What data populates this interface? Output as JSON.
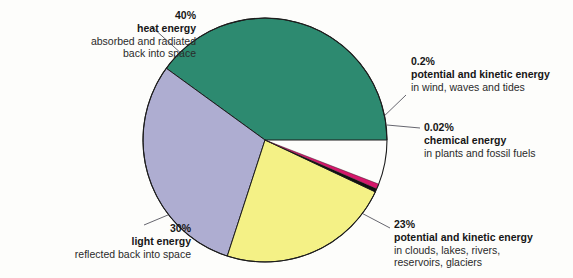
{
  "figure": {
    "background": "#fdfdfb",
    "pie": {
      "center_x": 265,
      "center_y": 140,
      "radius": 122,
      "outline_color": "#1d1d1d"
    }
  },
  "chart_data": {
    "type": "pie",
    "title": "",
    "subtitle": "",
    "xlabel": "",
    "ylabel": "",
    "legend_position": "callouts-around-pie",
    "grid": false,
    "total_percent": 93.22,
    "categories": [
      "heat energy",
      "light energy",
      "potential and kinetic energy (water)",
      "potential and kinetic energy (wind)",
      "chemical energy"
    ],
    "values": [
      40,
      30,
      23,
      0.2,
      0.02
    ],
    "slices": [
      {
        "id": "heat",
        "percent_label": "40%",
        "value": 40,
        "name": "heat energy",
        "description": "absorbed and radiated back into space",
        "color": "#2d8a70",
        "start_angle_deg": 0,
        "sweep_deg": 144
      },
      {
        "id": "light",
        "percent_label": "30%",
        "value": 30,
        "name": "light energy",
        "description": "reflected back into space",
        "color": "#aeadd1",
        "start_angle_deg": 144,
        "sweep_deg": 108
      },
      {
        "id": "water",
        "percent_label": "23%",
        "value": 23,
        "name": "potential and kinetic energy",
        "description": "in clouds, lakes, rivers, reservoirs, glaciers",
        "color": "#f4f186",
        "start_angle_deg": 252,
        "sweep_deg": 82.8
      },
      {
        "id": "chemical",
        "percent_label": "0.02%",
        "value": 0.02,
        "name": "chemical energy",
        "description": "in plants and fossil fuels",
        "color": "#111111",
        "start_angle_deg": 334.8,
        "sweep_deg": 1.6
      },
      {
        "id": "wind",
        "percent_label": "0.2%",
        "value": 0.2,
        "name": "potential and kinetic energy",
        "description": "in wind, waves and tides",
        "color": "#d6176b",
        "start_angle_deg": 336.4,
        "sweep_deg": 2.4
      }
    ]
  },
  "callouts": {
    "heat": {
      "percent": "40%",
      "headline": "heat energy",
      "line1": "absorbed and radiated",
      "line2": "back into space"
    },
    "wind": {
      "percent": "0.2%",
      "headline": "potential and kinetic energy",
      "line1": "in wind, waves and tides",
      "line2": ""
    },
    "chemical": {
      "percent": "0.02%",
      "headline": "chemical energy",
      "line1": "in plants and fossil fuels",
      "line2": ""
    },
    "water": {
      "percent": "23%",
      "headline": "potential and kinetic energy",
      "line1": "in clouds, lakes, rivers,",
      "line2": "reservoirs, glaciers"
    },
    "light": {
      "percent": "30%",
      "headline": "light energy",
      "line1": "reflected back into space",
      "line2": ""
    }
  },
  "leader_lines": {
    "color": "#55555f"
  }
}
